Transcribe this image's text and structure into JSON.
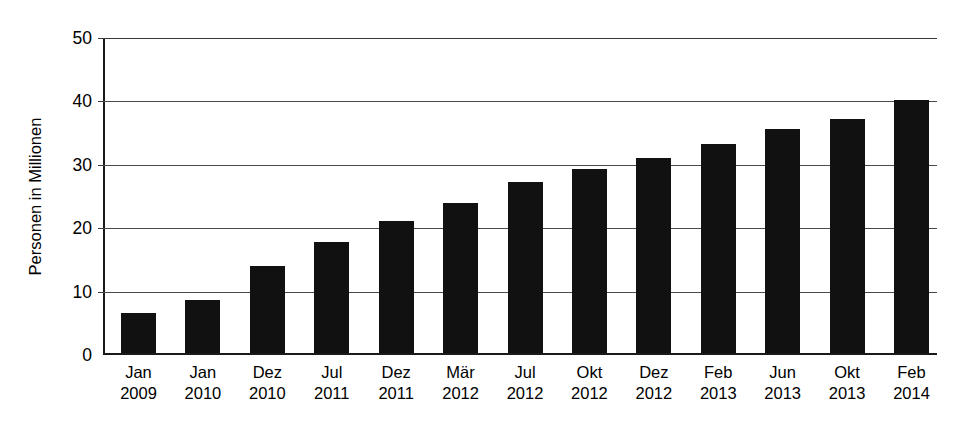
{
  "chart_data": {
    "type": "bar",
    "title": "",
    "subtitle": "",
    "xlabel": "",
    "ylabel": "Personen in Millionen",
    "ylim": [
      0,
      50
    ],
    "ytick_labels": [
      "50",
      "40",
      "30",
      "20",
      "10",
      "0"
    ],
    "yticks": [
      50,
      40,
      30,
      20,
      10,
      0
    ],
    "grid": true,
    "legend": null,
    "bar_color": "#111111",
    "background_color": "#ffffff",
    "categories": [
      "Jan 2009",
      "Jan 2010",
      "Dez 2010",
      "Jul 2011",
      "Dez 2011",
      "Mär 2012",
      "Jul 2012",
      "Okt 2012",
      "Dez 2012",
      "Feb 2013",
      "Jun 2013",
      "Okt 2013",
      "Feb 2014"
    ],
    "category_months": [
      "Jan",
      "Jan",
      "Dez",
      "Jul",
      "Dez",
      "Mär",
      "Jul",
      "Okt",
      "Dez",
      "Feb",
      "Jun",
      "Okt",
      "Feb"
    ],
    "category_years": [
      "2009",
      "2010",
      "2010",
      "2011",
      "2011",
      "2012",
      "2012",
      "2012",
      "2012",
      "2013",
      "2013",
      "2013",
      "2014"
    ],
    "values": [
      6.6,
      8.7,
      14.2,
      18.0,
      21.3,
      24.1,
      27.4,
      29.6,
      31.2,
      33.5,
      35.8,
      37.5,
      40.5
    ]
  }
}
